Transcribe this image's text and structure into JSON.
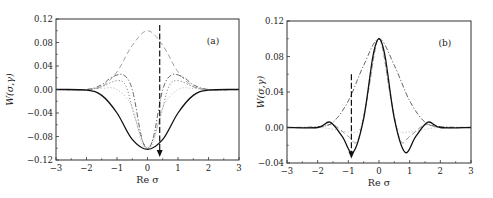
{
  "chart_data": [
    {
      "type": "line",
      "panel_label": "(a)",
      "xlabel": "Re σ",
      "ylabel": "W(σ,γ)",
      "xlim": [
        -3,
        3
      ],
      "ylim": [
        -0.12,
        0.12
      ],
      "xticks": [
        "−3",
        "−2",
        "−1",
        "0",
        "1",
        "2",
        "3"
      ],
      "yticks": [
        "0.12",
        "0.08",
        "0.04",
        "0.00",
        "−0.04",
        "−0.08",
        "−0.12"
      ],
      "grid": false,
      "legend": null,
      "annotation": {
        "type": "arrow",
        "style": "dashed",
        "direction": "down",
        "x": 0.4,
        "y_from": 0.11,
        "y_to": -0.115
      },
      "series": [
        {
          "name": "solid",
          "style": "solid",
          "color": "#111111",
          "x": [
            -3,
            -2,
            -1.5,
            -1,
            -0.5,
            0,
            0.5,
            1,
            1.5,
            2,
            3
          ],
          "values": [
            0.0,
            -0.001,
            -0.01,
            -0.04,
            -0.085,
            -0.102,
            -0.085,
            -0.04,
            -0.01,
            -0.001,
            0.0
          ]
        },
        {
          "name": "dash-dot",
          "style": "dash-dot",
          "color": "#555555",
          "x": [
            -3,
            -2,
            -1.5,
            -1.2,
            -0.8,
            -0.5,
            -0.2,
            0,
            0.2,
            0.5,
            0.8,
            1.2,
            1.5,
            2,
            3
          ],
          "values": [
            0.0,
            0.0,
            0.008,
            0.02,
            0.025,
            0.0,
            -0.08,
            -0.1,
            -0.08,
            0.0,
            0.025,
            0.02,
            0.008,
            0.0,
            0.0
          ]
        },
        {
          "name": "dotted",
          "style": "dotted",
          "color": "#777777",
          "x": [
            -3,
            -2,
            -1.5,
            -1,
            -0.7,
            -0.4,
            0,
            0.4,
            0.7,
            1,
            1.5,
            2,
            3
          ],
          "values": [
            0.0,
            0.0,
            0.005,
            0.015,
            0.005,
            -0.05,
            -0.1,
            -0.05,
            0.005,
            0.015,
            0.005,
            0.0,
            0.0
          ]
        },
        {
          "name": "dashed",
          "style": "dashed",
          "color": "#999999",
          "x": [
            -3,
            -2,
            -1.5,
            -1,
            -0.5,
            0,
            0.5,
            1,
            1.5,
            2,
            3
          ],
          "values": [
            0.0,
            0.0,
            0.005,
            0.03,
            0.075,
            0.1,
            0.075,
            0.03,
            0.005,
            0.0,
            0.0
          ]
        },
        {
          "name": "light-dotted",
          "style": "dotted",
          "color": "#bbbbbb",
          "x": [
            -3,
            -2,
            -1.5,
            -1,
            -0.5,
            -0.2,
            0,
            0.2,
            0.5,
            1,
            1.5,
            2,
            3
          ],
          "values": [
            0.0,
            0.0,
            0.002,
            0.0,
            -0.03,
            -0.09,
            -0.1,
            -0.09,
            -0.03,
            0.0,
            0.002,
            0.0,
            0.0
          ]
        }
      ]
    },
    {
      "type": "line",
      "panel_label": "(b)",
      "xlabel": "Re σ",
      "ylabel": "W(σ,γ)",
      "xlim": [
        -3,
        3
      ],
      "ylim": [
        -0.04,
        0.12
      ],
      "xticks": [
        "−3",
        "−2",
        "−1",
        "0",
        "1",
        "2",
        "3"
      ],
      "yticks": [
        "0.12",
        "0.08",
        "0.04",
        "0.00",
        "−0.04"
      ],
      "grid": false,
      "legend": null,
      "annotation": {
        "type": "arrow",
        "style": "dashed",
        "direction": "down",
        "x": -0.9,
        "y_from": 0.06,
        "y_to": -0.035
      },
      "series": [
        {
          "name": "solid",
          "style": "solid",
          "color": "#111111",
          "x": [
            -3,
            -2,
            -1.6,
            -1.2,
            -0.85,
            -0.5,
            -0.2,
            0,
            0.2,
            0.5,
            0.85,
            1.2,
            1.6,
            2,
            3
          ],
          "values": [
            0.0,
            0.0,
            0.006,
            -0.01,
            -0.028,
            0.01,
            0.08,
            0.1,
            0.08,
            0.01,
            -0.028,
            -0.01,
            0.006,
            0.0,
            0.0
          ]
        },
        {
          "name": "dash-dot",
          "style": "dash-dot",
          "color": "#555555",
          "x": [
            -3,
            -2,
            -1.5,
            -1,
            -0.5,
            0,
            0.5,
            1,
            1.5,
            2,
            3
          ],
          "values": [
            0.0,
            0.001,
            0.006,
            0.03,
            0.07,
            0.1,
            0.07,
            0.03,
            0.006,
            0.001,
            0.0
          ]
        },
        {
          "name": "dashed",
          "style": "dashed",
          "color": "#888888",
          "x": [
            -3,
            -2,
            -1.5,
            -1,
            -0.7,
            -0.4,
            0,
            0.4,
            0.7,
            1,
            1.5,
            2,
            3
          ],
          "values": [
            0.0,
            0.0,
            0.003,
            -0.01,
            -0.015,
            0.03,
            0.1,
            0.03,
            -0.015,
            -0.01,
            0.003,
            0.0,
            0.0
          ]
        },
        {
          "name": "dotted",
          "style": "dotted",
          "color": "#bbbbbb",
          "x": [
            -3,
            -2,
            -1.5,
            -1,
            -0.6,
            -0.3,
            0,
            0.3,
            0.6,
            1,
            1.5,
            2,
            3
          ],
          "values": [
            0.0,
            0.0,
            -0.002,
            -0.005,
            0.0,
            0.05,
            0.1,
            0.05,
            0.0,
            -0.005,
            -0.002,
            0.0,
            0.0
          ]
        }
      ]
    }
  ],
  "panels": {
    "a": {
      "tag": "(a)",
      "xlabel": "Re σ",
      "ylabel": "W(σ,γ)"
    },
    "b": {
      "tag": "(b)",
      "xlabel": "Re σ",
      "ylabel": "W(σ,γ)"
    }
  }
}
